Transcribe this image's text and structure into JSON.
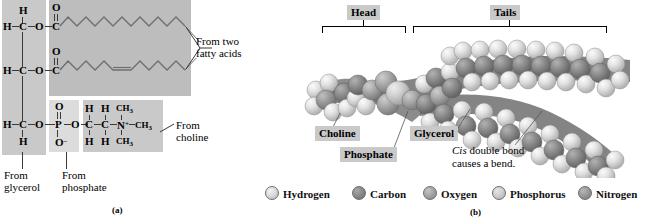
{
  "figure": {
    "panel_a_letter": "(a)",
    "panel_b_letter": "(b)"
  },
  "panel_a": {
    "glycerol_carbons": [
      {
        "h_left": "H",
        "c": "C",
        "o": "O",
        "h_top": "H"
      },
      {
        "h_left": "H",
        "c": "C",
        "o": "O"
      },
      {
        "h_left": "H",
        "c": "C",
        "o": "O",
        "h_bottom": "H"
      }
    ],
    "ester_top": {
      "o_double": "O",
      "c": "C"
    },
    "ester_mid": {
      "o_double": "O",
      "c": "C"
    },
    "phosphate": {
      "o_double": "O",
      "p": "P",
      "o_right": "O",
      "o_minus": "O",
      "charge": "–"
    },
    "choline": {
      "h_top_1": "H",
      "h_top_2": "H",
      "ch3_top": "CH",
      "ch3_top_sub": "3",
      "c1": "C",
      "c2": "C",
      "n": "N",
      "n_charge": "+",
      "ch3_right": "CH",
      "ch3_right_sub": "3",
      "h_bot_1": "H",
      "h_bot_2": "H",
      "ch3_bot": "CH",
      "ch3_bot_sub": "3"
    },
    "labels": {
      "fatty_acids": "From two\nfatty acids",
      "choline": "From\ncholine",
      "glycerol": "From\nglycerol",
      "phosphate": "From\nphosphate"
    }
  },
  "panel_b": {
    "brackets": [
      {
        "label": "Head"
      },
      {
        "label": "Tails"
      }
    ],
    "callouts": [
      {
        "label": "Choline"
      },
      {
        "label": "Phosphate"
      },
      {
        "label": "Glycerol"
      }
    ],
    "annotation": {
      "italic": "Cis",
      "rest": " double bond",
      "line2": "causes a bend."
    },
    "legend": [
      {
        "name": "Hydrogen",
        "swatch": "hydrogen-ball",
        "color": "#dcdcdc"
      },
      {
        "name": "Carbon",
        "swatch": "carbon-ball",
        "color": "#8a8a8a"
      },
      {
        "name": "Oxygen",
        "swatch": "oxygen-ball",
        "color": "#a6a6a6"
      },
      {
        "name": "Phosphorus",
        "swatch": "phosphorus-ball",
        "color": "#cfcfcf"
      },
      {
        "name": "Nitrogen",
        "swatch": "nitrogen-ball",
        "color": "#9a9a9a"
      }
    ]
  }
}
